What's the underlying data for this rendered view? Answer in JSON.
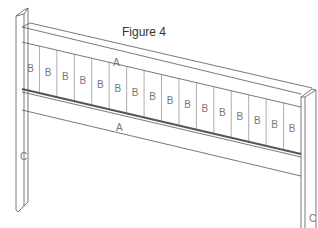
{
  "figure": {
    "caption": "Figure 4",
    "parts": {
      "rail_label": "A",
      "slat_label": "B",
      "post_label": "C"
    },
    "slat_count": 16,
    "colors": {
      "line": "#555555",
      "label": "#777777",
      "background": "#ffffff"
    }
  }
}
